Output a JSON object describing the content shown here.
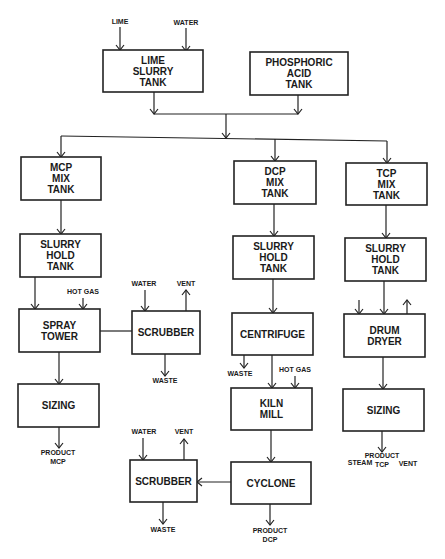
{
  "diagram": {
    "type": "process-flow",
    "boxes": [
      {
        "id": "lime_slurry_tank",
        "lines": [
          "LIME",
          "SLURRY",
          "TANK"
        ],
        "x": 103,
        "y": 50,
        "w": 100,
        "h": 42
      },
      {
        "id": "phosphoric_acid_tank",
        "lines": [
          "PHOSPHORIC",
          "ACID",
          "TANK"
        ],
        "x": 250,
        "y": 52,
        "w": 98,
        "h": 43
      },
      {
        "id": "mcp_mix_tank",
        "lines": [
          "MCP",
          "MIX",
          "TANK"
        ],
        "x": 21,
        "y": 157,
        "w": 80,
        "h": 43
      },
      {
        "id": "mcp_slurry_hold_tank",
        "lines": [
          "SLURRY",
          "HOLD",
          "TANK"
        ],
        "x": 20,
        "y": 234,
        "w": 81,
        "h": 43
      },
      {
        "id": "spray_tower",
        "lines": [
          "SPRAY",
          "TOWER"
        ],
        "x": 19,
        "y": 309,
        "w": 81,
        "h": 43
      },
      {
        "id": "scrubber_1",
        "lines": [
          "SCRUBBER"
        ],
        "x": 132,
        "y": 311,
        "w": 68,
        "h": 43
      },
      {
        "id": "mcp_sizing",
        "lines": [
          "SIZING"
        ],
        "x": 18,
        "y": 384,
        "w": 81,
        "h": 43
      },
      {
        "id": "dcp_mix_tank",
        "lines": [
          "DCP",
          "MIX",
          "TANK"
        ],
        "x": 234,
        "y": 161,
        "w": 82,
        "h": 43
      },
      {
        "id": "dcp_slurry_hold_tank",
        "lines": [
          "SLURRY",
          "HOLD",
          "TANK"
        ],
        "x": 233,
        "y": 236,
        "w": 81,
        "h": 43
      },
      {
        "id": "centrifuge",
        "lines": [
          "CENTRIFUGE"
        ],
        "x": 232,
        "y": 313,
        "w": 81,
        "h": 42
      },
      {
        "id": "kiln_mill",
        "lines": [
          "KILN",
          "MILL"
        ],
        "x": 231,
        "y": 388,
        "w": 81,
        "h": 42
      },
      {
        "id": "cyclone",
        "lines": [
          "CYCLONE"
        ],
        "x": 231,
        "y": 462,
        "w": 80,
        "h": 42
      },
      {
        "id": "scrubber_2",
        "lines": [
          "SCRUBBER"
        ],
        "x": 130,
        "y": 460,
        "w": 67,
        "h": 42
      },
      {
        "id": "tcp_mix_tank",
        "lines": [
          "TCP",
          "MIX",
          "TANK"
        ],
        "x": 346,
        "y": 163,
        "w": 81,
        "h": 42
      },
      {
        "id": "tcp_slurry_hold_tank",
        "lines": [
          "SLURRY",
          "HOLD",
          "TANK"
        ],
        "x": 345,
        "y": 238,
        "w": 81,
        "h": 43
      },
      {
        "id": "drum_dryer",
        "lines": [
          "DRUM",
          "DRYER"
        ],
        "x": 344,
        "y": 314,
        "w": 81,
        "h": 43
      },
      {
        "id": "tcp_sizing",
        "lines": [
          "SIZING"
        ],
        "x": 343,
        "y": 389,
        "w": 81,
        "h": 42
      }
    ],
    "stream_labels": [
      {
        "id": "lime_in",
        "text": "LIME",
        "x": 120,
        "y": 24
      },
      {
        "id": "water_in",
        "text": "WATER",
        "x": 186,
        "y": 25
      },
      {
        "id": "hot_gas_spray",
        "text": "HOT GAS",
        "x": 83,
        "y": 294
      },
      {
        "id": "water_scrubber_1",
        "text": "WATER",
        "x": 144,
        "y": 286
      },
      {
        "id": "vent_scrubber_1",
        "text": "VENT",
        "x": 186,
        "y": 286
      },
      {
        "id": "waste_scrubber_1",
        "text": "WASTE",
        "x": 165,
        "y": 383
      },
      {
        "id": "product_mcp_1",
        "text": "PRODUCT",
        "x": 58,
        "y": 455
      },
      {
        "id": "product_mcp_2",
        "text": "MCP",
        "x": 58,
        "y": 464
      },
      {
        "id": "waste_centrifuge",
        "text": "WASTE",
        "x": 240,
        "y": 376
      },
      {
        "id": "hot_gas_kiln",
        "text": "HOT GAS",
        "x": 295,
        "y": 372
      },
      {
        "id": "water_scrubber_2",
        "text": "WATER",
        "x": 144,
        "y": 434
      },
      {
        "id": "vent_scrubber_2",
        "text": "VENT",
        "x": 184,
        "y": 434
      },
      {
        "id": "waste_scrubber_2",
        "text": "WASTE",
        "x": 163,
        "y": 532
      },
      {
        "id": "product_dcp_1",
        "text": "PRODUCT",
        "x": 270,
        "y": 533
      },
      {
        "id": "product_dcp_2",
        "text": "DCP",
        "x": 270,
        "y": 542
      },
      {
        "id": "steam_drum",
        "text": "STEAM",
        "x": 360,
        "y": 465
      },
      {
        "id": "vent_drum",
        "text": "VENT",
        "x": 408,
        "y": 466
      },
      {
        "id": "product_tcp_1",
        "text": "PRODUCT",
        "x": 382,
        "y": 458
      },
      {
        "id": "product_tcp_2",
        "text": "TCP",
        "x": 382,
        "y": 467
      }
    ],
    "stroke_color": "#222222",
    "background": "#ffffff"
  }
}
